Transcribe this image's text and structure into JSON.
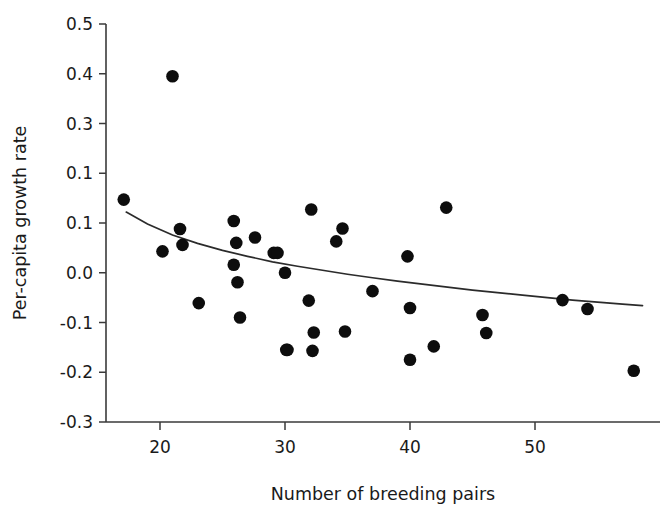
{
  "chart_data": {
    "type": "scatter",
    "title": "",
    "xlabel": "Number of breeding pairs",
    "ylabel": "Per-capita growth rate",
    "xlim": [
      17,
      59
    ],
    "ylim": [
      -0.3,
      0.5
    ],
    "xticks": [
      20,
      30,
      40,
      50
    ],
    "xtick_labels": [
      "20",
      "30",
      "40",
      "50"
    ],
    "yticks": [
      0.5,
      0.4,
      0.3,
      0.2,
      0.1,
      0.0,
      -0.1,
      -0.2,
      -0.3
    ],
    "ytick_labels": [
      "0.5",
      "0.4",
      "0.3",
      "0.1",
      "0.1",
      "0.0",
      "-0.1",
      "-0.2",
      "-0.3"
    ],
    "grid": false,
    "legend": null,
    "marker": "filled-circle",
    "marker_color": "#0d0d0d",
    "curve_color": "#2b2b2b",
    "x": [
      17.1,
      20.2,
      21.0,
      21.6,
      21.8,
      23.1,
      25.9,
      25.9,
      26.1,
      26.2,
      26.4,
      27.6,
      29.1,
      29.4,
      30.0,
      30.1,
      30.2,
      31.9,
      32.1,
      32.2,
      32.3,
      34.1,
      34.6,
      34.8,
      37.0,
      39.8,
      40.0,
      40.0,
      41.9,
      42.9,
      45.8,
      46.1,
      52.2,
      54.2,
      57.9
    ],
    "y": [
      0.147,
      0.043,
      0.395,
      0.088,
      0.056,
      -0.061,
      0.104,
      0.016,
      0.06,
      -0.019,
      -0.09,
      0.071,
      0.04,
      0.04,
      0.0,
      -0.155,
      -0.155,
      -0.056,
      0.127,
      -0.157,
      -0.12,
      0.063,
      0.089,
      -0.118,
      -0.037,
      0.033,
      -0.071,
      -0.175,
      -0.148,
      0.131,
      -0.085,
      -0.121,
      -0.055,
      -0.073,
      -0.197
    ],
    "fit": {
      "type": "power-decay",
      "note": "declining density-dependence curve",
      "x_points": [
        17.3,
        19.0,
        21.0,
        23.0,
        25.0,
        27.0,
        29.0,
        31.0,
        33.0,
        35.0,
        37.0,
        39.0,
        41.0,
        43.0,
        45.0,
        47.0,
        49.0,
        51.0,
        53.0,
        55.0,
        57.0,
        58.6
      ],
      "y_points": [
        0.122,
        0.098,
        0.076,
        0.059,
        0.045,
        0.033,
        0.022,
        0.013,
        0.005,
        -0.003,
        -0.01,
        -0.017,
        -0.023,
        -0.029,
        -0.035,
        -0.04,
        -0.045,
        -0.05,
        -0.055,
        -0.059,
        -0.063,
        -0.066
      ]
    }
  },
  "axes": {
    "x_title": "Number of breeding pairs",
    "y_title": "Per-capita growth rate"
  }
}
